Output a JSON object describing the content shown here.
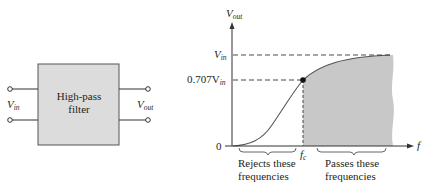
{
  "block_diagram": {
    "box_label_line1": "High-pass",
    "box_label_line2": "filter",
    "input_label": "V",
    "input_sub": "in",
    "output_label": "V",
    "output_sub": "out",
    "box_fill": "#dcdcdc"
  },
  "graph": {
    "y_axis_label": "V",
    "y_axis_sub": "out",
    "x_axis_label": "f",
    "vin_label": "V",
    "vin_sub": "in",
    "cutoff_level_label": "0.707V",
    "cutoff_level_sub": "in",
    "zero_label": "0",
    "fc_label": "f",
    "fc_sub": "c",
    "reject_line1": "Rejects these",
    "reject_line2": "frequencies",
    "pass_line1": "Passes these",
    "pass_line2": "frequencies",
    "shade_color": "#c8c8c8"
  }
}
